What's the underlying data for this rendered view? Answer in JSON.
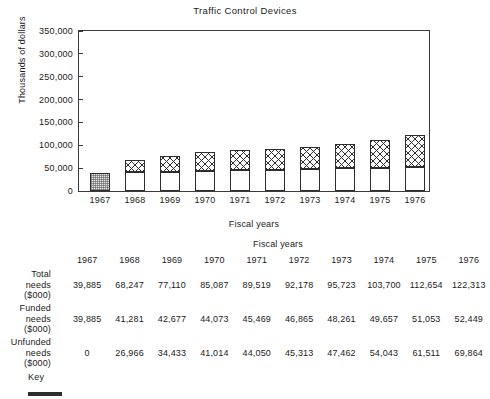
{
  "chart_data": {
    "type": "bar",
    "stacked": true,
    "title": "Traffic Control Devices",
    "xlabel": "Fiscal years",
    "ylabel": "Thousands of dollars",
    "categories": [
      "1967",
      "1968",
      "1969",
      "1970",
      "1971",
      "1972",
      "1973",
      "1974",
      "1975",
      "1976"
    ],
    "ylim": [
      0,
      350000
    ],
    "yticks": [
      0,
      50000,
      100000,
      150000,
      200000,
      250000,
      300000,
      350000
    ],
    "ytick_labels": [
      "0",
      "50,000",
      "100,000",
      "150,000",
      "200,000",
      "250,000",
      "300,000",
      "350,000"
    ],
    "grid": false,
    "legend_position": "below-table",
    "series": [
      {
        "name": "Funded needs ($000)",
        "pattern": "solid-white",
        "values": [
          39885,
          41281,
          42677,
          44073,
          45469,
          46865,
          48261,
          49657,
          51053,
          52449
        ]
      },
      {
        "name": "Unfunded needs ($000)",
        "pattern": "cross-hatch",
        "values": [
          0,
          26966,
          34433,
          41014,
          44050,
          45313,
          47462,
          54043,
          61511,
          69864
        ]
      }
    ],
    "totals": {
      "name": "Total needs ($000)",
      "values": [
        39885,
        68247,
        77110,
        85087,
        89519,
        92178,
        95723,
        103700,
        112654,
        122313
      ]
    }
  },
  "chart": {
    "title": "Traffic Control Devices",
    "y_axis_label": "Thousands of dollars",
    "x_axis_label": "Fiscal years",
    "y_ticks": [
      "350,000",
      "300,000",
      "250,000",
      "200,000",
      "150,000",
      "100,000",
      "50,000",
      "0"
    ],
    "x_ticks": [
      "1967",
      "1968",
      "1969",
      "1970",
      "1971",
      "1972",
      "1973",
      "1974",
      "1975",
      "1976"
    ]
  },
  "table": {
    "caption": "Fiscal years",
    "columns": [
      "1967",
      "1968",
      "1969",
      "1970",
      "1971",
      "1972",
      "1973",
      "1974",
      "1975",
      "1976"
    ],
    "rows": [
      {
        "label_line1": "Total",
        "label_line2": "needs",
        "label_line3": "($000)",
        "values": [
          "39,885",
          "68,247",
          "77,110",
          "85,087",
          "89,519",
          "92,178",
          "95,723",
          "103,700",
          "112,654",
          "122,313"
        ]
      },
      {
        "label_line1": "Funded",
        "label_line2": "needs",
        "label_line3": "($000)",
        "values": [
          "39,885",
          "41,281",
          "42,677",
          "44,073",
          "45,469",
          "46,865",
          "48,261",
          "49,657",
          "51,053",
          "52,449"
        ]
      },
      {
        "label_line1": "Unfunded",
        "label_line2": "needs",
        "label_line3": "($000)",
        "values": [
          "0",
          "26,966",
          "34,433",
          "41,014",
          "44,050",
          "45,313",
          "47,462",
          "54,043",
          "61,511",
          "69,864"
        ]
      }
    ]
  },
  "key": {
    "label": "Key"
  },
  "colors": {
    "ink": "#1b1b1b",
    "axis": "#3a3a3a",
    "bar_outline": "#2d2d2d",
    "hatch": "#2f2f2f",
    "stipple_fill": "#e2e2e2",
    "background": "#ffffff"
  }
}
